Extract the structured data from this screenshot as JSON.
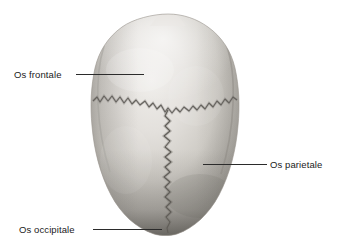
{
  "figure": {
    "background_color": "#ffffff",
    "width": 337,
    "height": 246
  },
  "labels": [
    {
      "id": "os-frontale",
      "text": "Os frontale",
      "side": "left",
      "target": "frontal bone",
      "leader_color": "#2b2b2b"
    },
    {
      "id": "os-parietale",
      "text": "Os parietale",
      "side": "right",
      "target": "parietal bone",
      "leader_color": "#2b2b2b"
    },
    {
      "id": "os-occipitale",
      "text": "Os occipitale",
      "side": "left",
      "target": "occipital bone",
      "leader_color": "#2b2b2b"
    }
  ],
  "anatomy": {
    "specimen": "skull viewed from above",
    "sutures": [
      {
        "name": "sutura coronalis",
        "orientation": "transverse"
      },
      {
        "name": "sutura sagittalis",
        "orientation": "longitudinal"
      }
    ],
    "bone_tone_light": "#e8e6e2",
    "bone_tone_mid": "#c9c6c0",
    "bone_tone_dark": "#8d8a85",
    "suture_color": "#5a5752"
  }
}
